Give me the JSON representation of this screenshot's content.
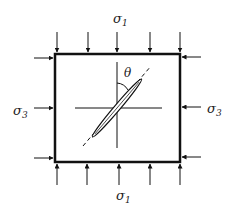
{
  "diagram": {
    "labels": {
      "top_stress": {
        "symbol": "σ",
        "subscript": "1"
      },
      "bottom_stress": {
        "symbol": "σ",
        "subscript": "1"
      },
      "left_stress": {
        "symbol": "σ",
        "subscript": "3"
      },
      "right_stress": {
        "symbol": "σ",
        "subscript": "3"
      },
      "angle": "θ"
    },
    "top_arrow_count": 5,
    "bottom_arrow_count": 5,
    "side_arrow_count": 3,
    "colors": {
      "stroke": "#111111",
      "text": "#222222"
    }
  }
}
